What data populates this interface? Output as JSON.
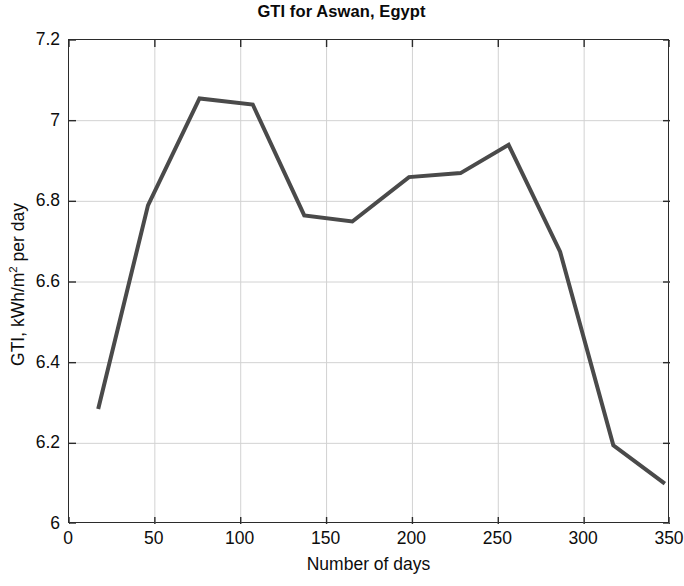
{
  "chart_data": {
    "type": "line",
    "title": "GTI for Aswan, Egypt",
    "xlabel": "Number of days",
    "ylabel": "GTI, kWh/m2 per day",
    "ylabel_prefix": "GTI, kWh/m",
    "ylabel_exponent": "2",
    "ylabel_suffix": " per day",
    "xlim": [
      0,
      350
    ],
    "ylim": [
      6,
      7.2
    ],
    "grid": true,
    "legend": "none",
    "line_color": "#4a4a4a",
    "line_width": 4,
    "xticks": [
      0,
      50,
      100,
      150,
      200,
      250,
      300,
      350
    ],
    "xtick_labels": [
      "0",
      "50",
      "100",
      "150",
      "200",
      "250",
      "300",
      "350"
    ],
    "yticks": [
      6,
      6.2,
      6.4,
      6.6,
      6.8,
      7,
      7.2
    ],
    "ytick_labels": [
      "6",
      "6.2",
      "6.4",
      "6.6",
      "6.8",
      "7",
      "7.2"
    ],
    "x": [
      17,
      46,
      76,
      107,
      137,
      165,
      198,
      228,
      256,
      286,
      317,
      347
    ],
    "values": [
      6.285,
      6.79,
      7.055,
      7.04,
      6.765,
      6.75,
      6.86,
      6.87,
      6.94,
      6.675,
      6.195,
      6.1
    ],
    "series": [
      {
        "name": "GTI",
        "x": [
          17,
          46,
          76,
          107,
          137,
          165,
          198,
          228,
          256,
          286,
          317,
          347
        ],
        "values": [
          6.285,
          6.79,
          7.055,
          7.04,
          6.765,
          6.75,
          6.86,
          6.87,
          6.94,
          6.675,
          6.195,
          6.1
        ]
      }
    ]
  }
}
